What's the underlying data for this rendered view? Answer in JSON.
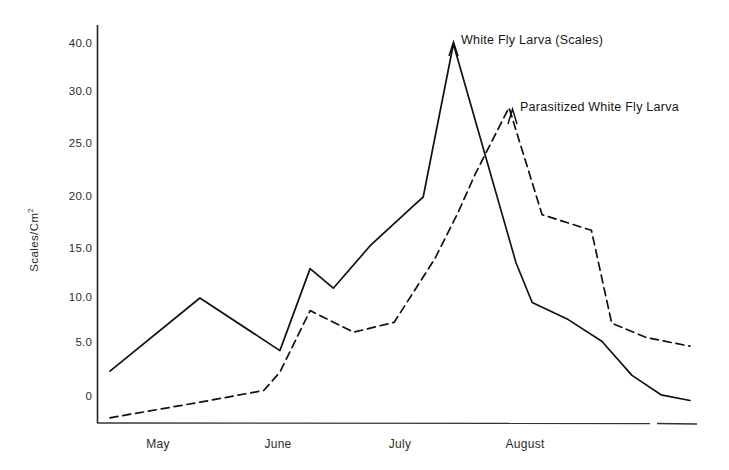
{
  "chart_data": {
    "type": "line",
    "title": "",
    "xlabel": "",
    "ylabel": "Scales/Cm²",
    "ylabel_base": "Scales/Cm",
    "ylabel_exponent": "2",
    "grid": false,
    "legend_position": "inline-annotations",
    "ylim": [
      -1.5,
      41
    ],
    "ytick_labels": [
      "40.0",
      "30.0",
      "25.0",
      "20.0",
      "15.0",
      "10.0",
      "5.0",
      "0"
    ],
    "ytick_values": [
      40.0,
      30.0,
      25.0,
      20.0,
      15.0,
      10.0,
      5.0,
      0
    ],
    "y_axis_note": "irregular spacing: compressed between 30.0 and 40.0",
    "xtick_labels": [
      "May",
      "June",
      "July",
      "August"
    ],
    "x_axis_note": "months May through August, sampling dates unlabeled",
    "series": [
      {
        "name": "White Fly Larva (Scales)",
        "style": "solid",
        "color": "#111111",
        "label_text": "White Fly Larva (Scales)",
        "points": [
          {
            "x": 0.0,
            "y": 2.4
          },
          {
            "x": 0.155,
            "y": 10.0
          },
          {
            "x": 0.293,
            "y": 4.3
          },
          {
            "x": 0.345,
            "y": 13.0
          },
          {
            "x": 0.385,
            "y": 11.0
          },
          {
            "x": 0.45,
            "y": 15.4
          },
          {
            "x": 0.524,
            "y": 19.2
          },
          {
            "x": 0.54,
            "y": 20.0
          },
          {
            "x": 0.592,
            "y": 40.0
          },
          {
            "x": 0.7,
            "y": 13.6
          },
          {
            "x": 0.728,
            "y": 9.5
          },
          {
            "x": 0.79,
            "y": 7.6
          },
          {
            "x": 0.848,
            "y": 5.2
          },
          {
            "x": 0.9,
            "y": 2.0
          },
          {
            "x": 0.95,
            "y": 0.2
          },
          {
            "x": 1.0,
            "y": -0.2
          }
        ]
      },
      {
        "name": "Parasitized White Fly Larva",
        "style": "dashed",
        "color": "#111111",
        "label_text": "Parasitized White Fly Larva",
        "points": [
          {
            "x": 0.0,
            "y": -1.2
          },
          {
            "x": 0.155,
            "y": -0.3
          },
          {
            "x": 0.265,
            "y": 0.6
          },
          {
            "x": 0.293,
            "y": 2.3
          },
          {
            "x": 0.345,
            "y": 8.6
          },
          {
            "x": 0.42,
            "y": 6.2
          },
          {
            "x": 0.49,
            "y": 7.3
          },
          {
            "x": 0.56,
            "y": 14.0
          },
          {
            "x": 0.6,
            "y": 18.5
          },
          {
            "x": 0.63,
            "y": 22.2
          },
          {
            "x": 0.688,
            "y": 28.5
          },
          {
            "x": 0.745,
            "y": 18.3
          },
          {
            "x": 0.83,
            "y": 16.8
          },
          {
            "x": 0.865,
            "y": 7.2
          },
          {
            "x": 0.925,
            "y": 5.6
          },
          {
            "x": 1.0,
            "y": 4.7
          }
        ]
      }
    ],
    "annotations": [
      {
        "text": "White Fly Larva (Scales)",
        "marker": "caret-up",
        "points_to": "solid series peak (40.0)"
      },
      {
        "text": "Parasitized White Fly Larva",
        "marker": "caret-up",
        "points_to": "dashed series peak (28.5)"
      }
    ]
  }
}
